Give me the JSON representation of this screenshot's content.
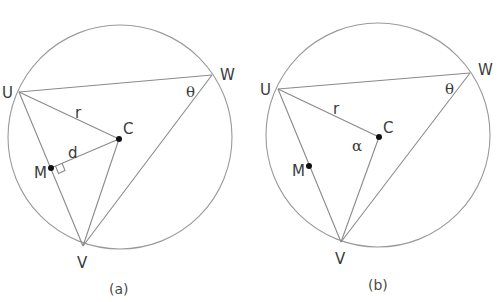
{
  "figures": [
    {
      "id": "a",
      "caption": "(a)",
      "points": {
        "U": {
          "label": "U"
        },
        "W": {
          "label": "W"
        },
        "V": {
          "label": "V"
        },
        "C": {
          "label": "C"
        },
        "M": {
          "label": "M"
        }
      },
      "segment_labels": {
        "UC": "r",
        "MC": "d"
      },
      "angle_labels": {
        "W": "θ"
      },
      "right_angle_marker_at": "M"
    },
    {
      "id": "b",
      "caption": "(b)",
      "points": {
        "U": {
          "label": "U"
        },
        "W": {
          "label": "W"
        },
        "V": {
          "label": "V"
        },
        "C": {
          "label": "C"
        },
        "M": {
          "label": "M"
        }
      },
      "segment_labels": {
        "UC": "r"
      },
      "angle_labels": {
        "W": "θ",
        "C": "α"
      }
    }
  ]
}
